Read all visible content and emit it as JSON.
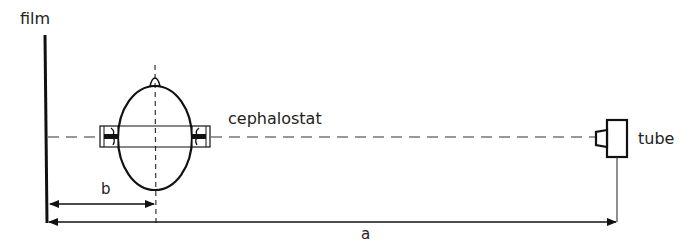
{
  "labels": {
    "film": "film",
    "cephalostat": "cephalostat",
    "tube": "tube",
    "distance_b": "b",
    "distance_a": "a"
  },
  "colors": {
    "stroke": "#111111",
    "text": "#222222",
    "background": "#ffffff"
  },
  "geometry": {
    "film_x": 45,
    "central_axis_y": 137,
    "head_center_x": 155,
    "tube_x": 617,
    "dimension_b": {
      "from": "film",
      "to": "head midsagittal plane"
    },
    "dimension_a": {
      "from": "film",
      "to": "tube focal spot"
    }
  }
}
